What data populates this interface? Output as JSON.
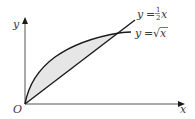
{
  "figure": {
    "axes": {
      "x_label": "x",
      "y_label": "y",
      "origin_label": "O"
    },
    "curves": [
      {
        "name": "line",
        "equation_lhs": "y",
        "equals": "=",
        "coef_num": "1",
        "coef_den": "2",
        "var": "x",
        "label": "y = ½x"
      },
      {
        "name": "sqrt",
        "equation_lhs": "y",
        "equals": "=",
        "sqrt_symbol": "√",
        "var": "x",
        "label": "y = √x"
      }
    ],
    "shaded_region": "area between y = √x and y = ½x",
    "colors": {
      "stroke": "#1a1a1a",
      "fill": "#e6e6e6",
      "text": "#3a3a3a"
    }
  }
}
